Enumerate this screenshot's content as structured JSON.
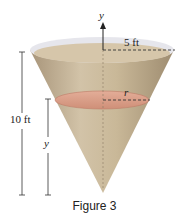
{
  "figure": {
    "caption": "Figure 3",
    "labels": {
      "y_axis": "y",
      "top_radius": "5 ft",
      "slice_radius": "r",
      "height": "10 ft",
      "slice_height": "y"
    },
    "colors": {
      "cone_fill": "#cbb99c",
      "cone_shade": "#b9a682",
      "rim": "#e4e4ea",
      "slice": "#d99a85",
      "slice_edge": "#c07a66",
      "line": "#333333"
    }
  }
}
